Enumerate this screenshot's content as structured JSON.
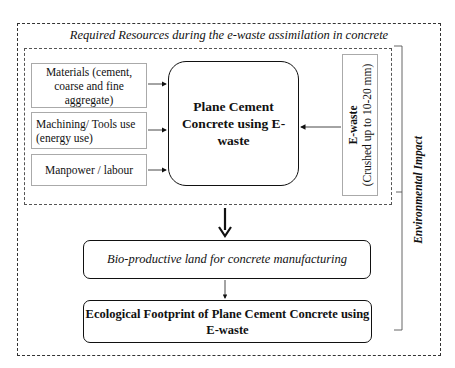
{
  "diagram": {
    "outer_title": "Required Resources during the e-waste assimilation in concrete",
    "inputs": [
      {
        "label": "Materials (cement, coarse and fine aggregate)"
      },
      {
        "label": "Machining/ Tools use (energy use)"
      },
      {
        "label": "Manpower / labour"
      }
    ],
    "center_node": "Plane Cement Concrete using E-waste",
    "ewaste": {
      "title": "E-waste",
      "subtitle": "(Crushed up to 10-20 mm)"
    },
    "bio_node": "Bio-productive land for concrete manufacturing",
    "result_node": "Ecological Footprint of Plane Cement Concrete using E-waste",
    "side_label": "Environmental Impact"
  }
}
